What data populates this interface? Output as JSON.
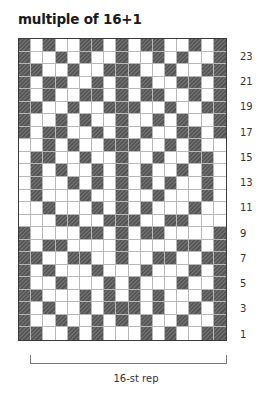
{
  "title": "multiple of 16+1",
  "repeat_label": "16-st rep",
  "grid": {
    "columns": 17,
    "rows": 24,
    "legend": {
      "D": "dark (contrast color)",
      "W": "light (main color)"
    },
    "row_labels": [
      "23",
      "21",
      "19",
      "17",
      "15",
      "13",
      "11",
      "9",
      "7",
      "5",
      "3",
      "1"
    ],
    "pattern_top_to_bottom": [
      "DWDWWDDWDWDDWWDWD",
      "DWWDWDWWDWWDWDWWD",
      "DDWWDWWDDDWWDWWDD",
      "DWDDWWDWDWDWWDDWD",
      "DWDWWDDWDWDDWWDWD",
      "DDWWDWWDDDWWDWWDD",
      "DWWDWDWWDWWDWDWWD",
      "DWDDWWDWDWDWWDDWD",
      "WWDWDWWDDDWWDWDWW",
      "WDDWWDWWDWWDWWDDW",
      "WDWDWWDWDWDWWDWDW",
      "WDWWDWDWDWDWDWWDW",
      "WDWWWDWWDWWDWWWDW",
      "WWDWWWDWDWDWWWDWW",
      "WWWDDWWDDDWWDDWWW",
      "DWWWWDDWDWDDWWWWD",
      "DWDDWWWWDWWWWDDWD",
      "DDWWDDWWDWWDDWWDD",
      "DWDWWWDWWWDWWWDWD",
      "DWWDWWWDWDWWWDWWD",
      "DDWWWDWDWDWDWWWDD",
      "DWDWWDWDDDWDWWDWD",
      "DWWDWWDWDWDWWDWWD",
      "DDWWDWDWWWDWDWWDD"
    ]
  },
  "colors": {
    "dark": "#5f5f5f",
    "light": "#ffffff",
    "grid_line": "#b8b8b8",
    "border": "#3a3a3a"
  }
}
